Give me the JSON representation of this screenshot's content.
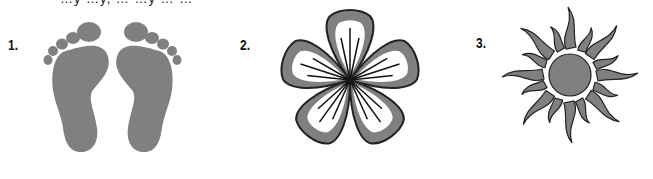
{
  "top_text": "…y …y, … …y … …",
  "figures": [
    {
      "label": "1.",
      "name": "footprints"
    },
    {
      "label": "2.",
      "name": "flower"
    },
    {
      "label": "3.",
      "name": "sun"
    }
  ],
  "colors": {
    "fill": "#808080",
    "outline": "#222222",
    "inner": "#ffffff"
  }
}
